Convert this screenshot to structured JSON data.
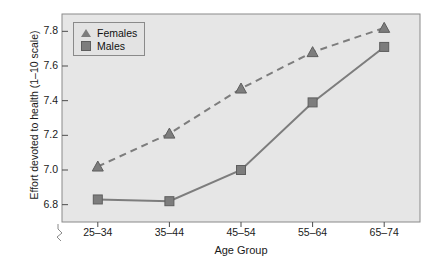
{
  "chart_data": {
    "type": "line",
    "title": "",
    "xlabel": "Age Group",
    "ylabel": "Effort devoted to health (1–10 scale)",
    "categories": [
      "25–34",
      "35–44",
      "45–54",
      "55–64",
      "65–74"
    ],
    "yticks": [
      "7.8",
      "7.6",
      "7.4",
      "7.2",
      "7.0",
      "6.8"
    ],
    "ylim": [
      6.7,
      7.9
    ],
    "axis_break": true,
    "grid": false,
    "legend_position": "top-left",
    "series": [
      {
        "name": "Females",
        "marker": "triangle",
        "linestyle": "dashed",
        "color": "#7d7d7d",
        "values": [
          7.02,
          7.21,
          7.47,
          7.68,
          7.82
        ]
      },
      {
        "name": "Males",
        "marker": "square",
        "linestyle": "solid",
        "color": "#7d7d7d",
        "values": [
          6.83,
          6.82,
          7.0,
          7.39,
          7.71
        ]
      }
    ]
  },
  "colors": {
    "plot_background": "#e6e6e6",
    "frame": "#8a8a8a",
    "series": "#7d7d7d",
    "text": "#1a1a1a",
    "page_background": "#ffffff"
  }
}
